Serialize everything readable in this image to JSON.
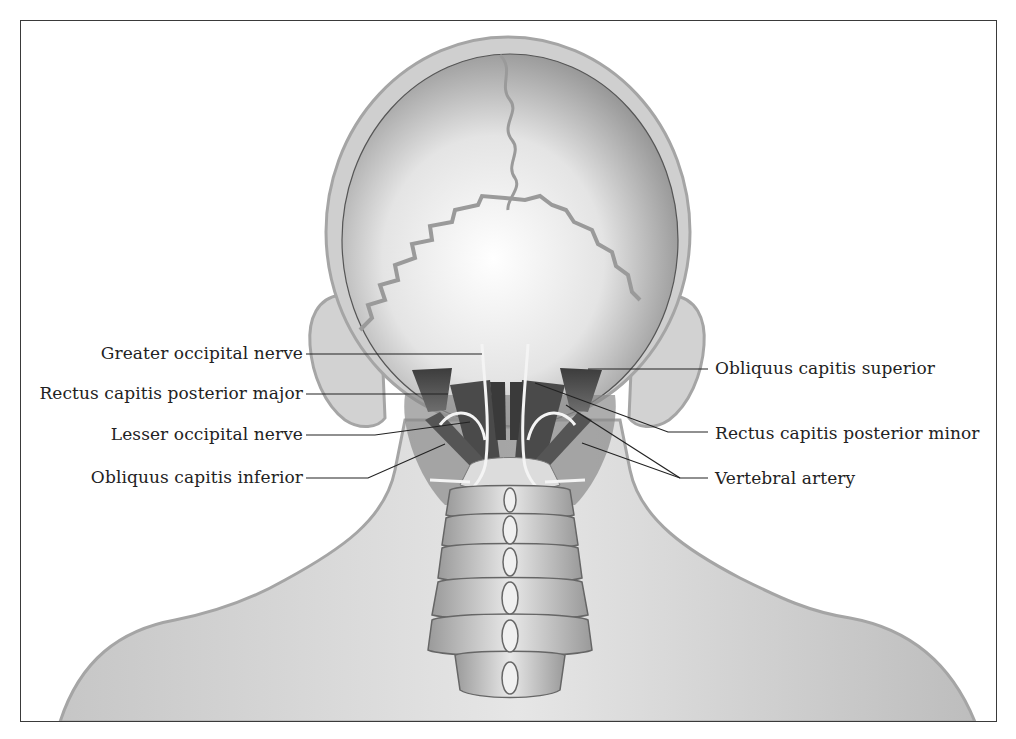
{
  "figure": {
    "colors": {
      "frame": "#3a3a3a",
      "skin": "#d6d6d6",
      "skin_edge": "#a9a9a9",
      "skull": "#e8e8e8",
      "muscle": "#5a5a5a",
      "nerve": "#f2f2f2",
      "leader_line": "#222222",
      "text": "#222222"
    }
  },
  "labels": {
    "left": [
      {
        "id": "greater-occipital-nerve",
        "text": "Greater occipital nerve"
      },
      {
        "id": "rectus-capitis-posterior-major",
        "text": "Rectus capitis posterior major"
      },
      {
        "id": "lesser-occipital-nerve",
        "text": "Lesser occipital nerve"
      },
      {
        "id": "obliquus-capitis-inferior",
        "text": "Obliquus capitis inferior"
      }
    ],
    "right": [
      {
        "id": "obliquus-capitis-superior",
        "text": "Obliquus capitis superior"
      },
      {
        "id": "rectus-capitis-posterior-minor",
        "text": "Rectus capitis posterior minor"
      },
      {
        "id": "vertebral-artery",
        "text": "Vertebral artery"
      }
    ]
  }
}
